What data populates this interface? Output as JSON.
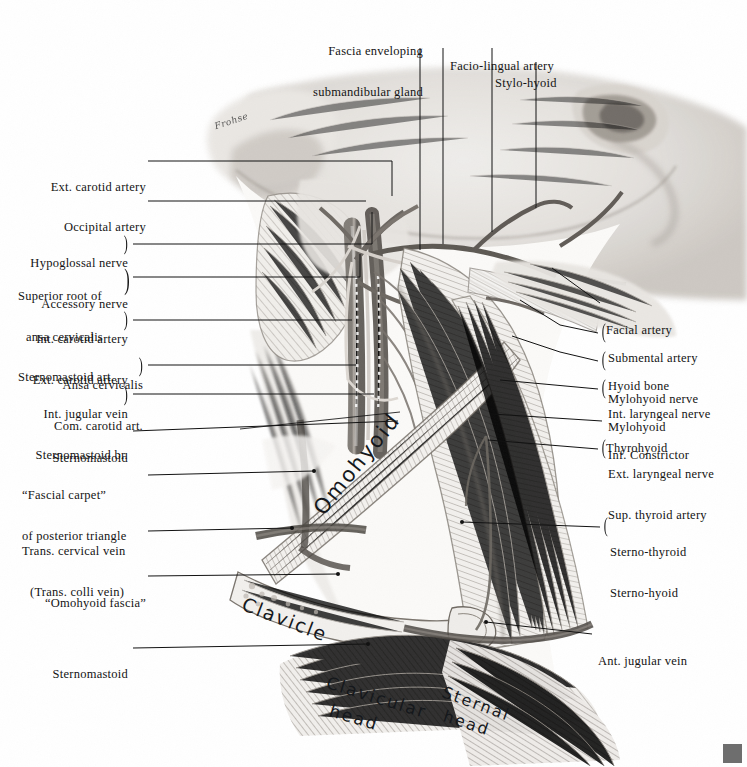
{
  "plate": {
    "title": "Dissection of the anterior and posterior triangles of the neck",
    "signature": "Frohse",
    "corner_mark_color": "#6e6e6e",
    "background": "#ffffff",
    "ink": "#121212"
  },
  "top_labels": [
    {
      "id": "fascia-submandibular",
      "lines": [
        "Fascia enveloping",
        "submandibular gland"
      ],
      "indent": [
        false,
        true
      ]
    },
    {
      "id": "facio-lingual-artery",
      "lines": [
        "Facio-lingual artery"
      ],
      "indent": [
        false
      ]
    },
    {
      "id": "stylo-hyoid",
      "lines": [
        "Stylo-hyoid"
      ],
      "indent": [
        false
      ]
    }
  ],
  "left_labels": [
    {
      "id": "ext-carotid-artery-1",
      "lines": [
        "Ext. carotid artery"
      ],
      "brace": false
    },
    {
      "id": "occipital-artery",
      "lines": [
        "Occipital artery"
      ],
      "brace": false
    },
    {
      "id": "hypoglossal-accessory",
      "lines": [
        "Hypoglossal nerve",
        "Accessory nerve"
      ],
      "brace": true
    },
    {
      "id": "superior-root-ansa",
      "lines": [
        "Superior root of",
        "ansa cervicalis",
        "Sternomastoid art."
      ],
      "brace": true
    },
    {
      "id": "int-ext-carotid",
      "lines": [
        "Int. carotid artery",
        "Ext. carotid artery"
      ],
      "brace": true
    },
    {
      "id": "ansa-cervicalis-com-carotid",
      "lines": [
        "Ansa cervicalis",
        "Com. carotid art."
      ],
      "brace": true
    },
    {
      "id": "int-jugular-sternomastoid-br",
      "lines": [
        "Int. jugular vein",
        "Sternomastoid br."
      ],
      "brace": true
    },
    {
      "id": "sternomastoid-upper",
      "lines": [
        "Sternomastoid"
      ],
      "brace": false
    },
    {
      "id": "fascial-carpet",
      "lines": [
        "“Fascial carpet”",
        "of posterior triangle"
      ],
      "brace": false
    },
    {
      "id": "trans-cervical-vein",
      "lines": [
        "Trans. cervical vein",
        "(Trans. colli vein)"
      ],
      "brace": false
    },
    {
      "id": "omohyoid-fascia",
      "lines": [
        "“Omohyoid fascia”"
      ],
      "brace": false
    },
    {
      "id": "sternomastoid-lower",
      "lines": [
        "Sternomastoid"
      ],
      "brace": false
    }
  ],
  "right_labels": [
    {
      "id": "facial-artery",
      "lines": [
        "Facial artery"
      ],
      "brace": false
    },
    {
      "id": "submental-mylohyoid-nerve",
      "lines": [
        "Submental artery",
        "Mylohyoid nerve"
      ],
      "brace": true
    },
    {
      "id": "hyoid-bone-mylohyoid",
      "lines": [
        "Hyoid bone",
        "Mylohyoid"
      ],
      "brace": true
    },
    {
      "id": "int-laryngeal-inf-constrictor",
      "lines": [
        "Int. laryngeal nerve",
        "Inf. Constrictor"
      ],
      "brace": true
    },
    {
      "id": "thyrohyoid",
      "lines": [
        "Thyrohyoid"
      ],
      "brace": false
    },
    {
      "id": "ext-laryngeal-sup-thyroid",
      "lines": [
        "Ext. laryngeal nerve",
        "Sup. thyroid artery"
      ],
      "brace": true
    },
    {
      "id": "sterno-thyroid-sterno-hyoid",
      "lines": [
        "Sterno-thyroid",
        "Sterno-hyoid"
      ],
      "brace": true
    },
    {
      "id": "ant-jugular-vein",
      "lines": [
        "Ant. jugular vein"
      ],
      "brace": false
    }
  ],
  "handwritten": [
    {
      "id": "omohyoid",
      "text": "Omohyoid"
    },
    {
      "id": "clavicle",
      "text": "Clavicle"
    },
    {
      "id": "clavicular-head-1",
      "text": "Clavicular"
    },
    {
      "id": "clavicular-head-2",
      "text": "head"
    },
    {
      "id": "sternal-head-1",
      "text": "Sternal"
    },
    {
      "id": "sternal-head-2",
      "text": "head"
    }
  ]
}
